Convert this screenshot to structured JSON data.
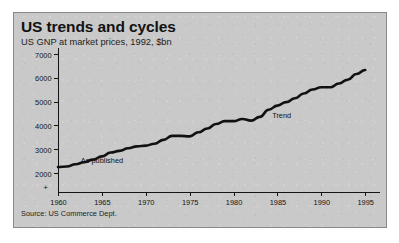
{
  "figure": {
    "title": "US trends and cycles",
    "subtitle": "US GNP at market prices, 1992, $bn",
    "source": "Source: US Commerce Dept.",
    "axis_break_marker": "+",
    "background_color": "#c9c9c9",
    "line_color": "#111111",
    "border_color": "#8a8a8a"
  },
  "chart_data": {
    "type": "line",
    "title": "US trends and cycles",
    "subtitle": "US GNP at market prices, 1992, $bn",
    "xlabel": "",
    "ylabel": "US GNP at market prices, 1992, $bn",
    "xlim": [
      1960,
      1996
    ],
    "ylim": [
      1800,
      7000
    ],
    "ytick_labels": [
      "2000",
      "3000",
      "4000",
      "5000",
      "6000",
      "7000"
    ],
    "yticks": [
      2000,
      3000,
      4000,
      5000,
      6000,
      7000
    ],
    "xtick_labels": [
      "1960",
      "1965",
      "1970",
      "1975",
      "1980",
      "1985",
      "1990",
      "1995"
    ],
    "xticks": [
      1960,
      1965,
      1970,
      1975,
      1980,
      1985,
      1990,
      1995
    ],
    "grid": false,
    "legend_position": "none",
    "axis_break": true,
    "annotations": [
      {
        "text": "As published",
        "x": 1962.6,
        "y": 2720
      },
      {
        "text": "Trend",
        "x": 1984.4,
        "y": 4620
      }
    ],
    "series": [
      {
        "name": "US GNP",
        "x": [
          1960,
          1961,
          1962,
          1963,
          1964,
          1965,
          1966,
          1967,
          1968,
          1969,
          1970,
          1971,
          1972,
          1973,
          1974,
          1975,
          1976,
          1977,
          1978,
          1979,
          1980,
          1981,
          1982,
          1983,
          1984,
          1985,
          1986,
          1987,
          1988,
          1989,
          1990,
          1991,
          1992,
          1993,
          1994,
          1995
        ],
        "values": [
          2250,
          2270,
          2370,
          2450,
          2560,
          2700,
          2860,
          2930,
          3040,
          3120,
          3150,
          3230,
          3390,
          3560,
          3560,
          3540,
          3710,
          3870,
          4060,
          4180,
          4180,
          4270,
          4200,
          4360,
          4660,
          4830,
          4980,
          5140,
          5340,
          5510,
          5600,
          5600,
          5760,
          5920,
          6160,
          6330
        ]
      }
    ]
  }
}
